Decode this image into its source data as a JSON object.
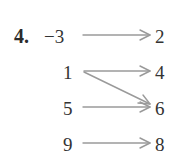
{
  "diagram": {
    "problem_number": "4.",
    "type": "mapping",
    "domain": [
      "−3",
      "1",
      "5",
      "9"
    ],
    "range": [
      "2",
      "4",
      "6",
      "8"
    ],
    "mappings": [
      {
        "from": "−3",
        "to": "2"
      },
      {
        "from": "1",
        "to": "4"
      },
      {
        "from": "1",
        "to": "6"
      },
      {
        "from": "5",
        "to": "6"
      },
      {
        "from": "9",
        "to": "8"
      }
    ],
    "colors": {
      "text": "#333333",
      "arrow": "#9a9a9a"
    }
  }
}
